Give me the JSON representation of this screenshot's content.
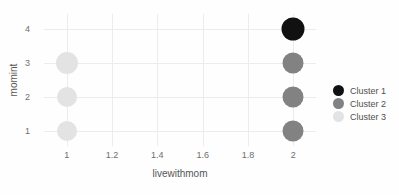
{
  "chart_data": {
    "type": "scatter",
    "title": "",
    "xlabel": "livewithmom",
    "ylabel": "momint",
    "xlim": [
      0.9,
      2.1
    ],
    "ylim": [
      0.55,
      4.45
    ],
    "xticks": [
      "1",
      "1.2",
      "1.4",
      "1.6",
      "1.8",
      "2"
    ],
    "xtick_values": [
      1,
      1.2,
      1.4,
      1.6,
      1.8,
      2
    ],
    "yticks": [
      "1",
      "2",
      "3",
      "4"
    ],
    "ytick_values": [
      1,
      2,
      3,
      4
    ],
    "grid": true,
    "legend_position": "right",
    "series": [
      {
        "name": "Cluster 1",
        "color": "#111111",
        "points": [
          {
            "x": 2,
            "y": 4,
            "size": 23
          }
        ]
      },
      {
        "name": "Cluster 2",
        "color": "#828282",
        "points": [
          {
            "x": 2,
            "y": 3,
            "size": 21
          },
          {
            "x": 2,
            "y": 2,
            "size": 21
          },
          {
            "x": 2,
            "y": 1,
            "size": 21
          }
        ]
      },
      {
        "name": "Cluster 3",
        "color": "#e3e3e3",
        "points": [
          {
            "x": 1,
            "y": 3,
            "size": 22
          },
          {
            "x": 1,
            "y": 2,
            "size": 20
          },
          {
            "x": 1,
            "y": 1,
            "size": 20
          }
        ]
      }
    ]
  },
  "legend": {
    "items": [
      {
        "label": "Cluster 1",
        "color": "#111111"
      },
      {
        "label": "Cluster 2",
        "color": "#828282"
      },
      {
        "label": "Cluster 3",
        "color": "#e3e3e3"
      }
    ]
  }
}
